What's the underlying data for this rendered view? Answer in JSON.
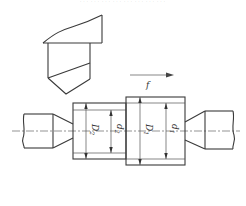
{
  "header": {
    "caption_fragment": "……………………"
  },
  "diagram": {
    "feed_label": "f",
    "dimensions": {
      "left": [
        {
          "symbol": "D",
          "subscript": "2"
        },
        {
          "symbol": "d",
          "subscript": "2"
        }
      ],
      "right": [
        {
          "symbol": "D",
          "subscript": "1"
        },
        {
          "symbol": "d",
          "subscript": "1"
        }
      ]
    },
    "colors": {
      "line": "#3a3a3a",
      "background": "#ffffff"
    }
  }
}
